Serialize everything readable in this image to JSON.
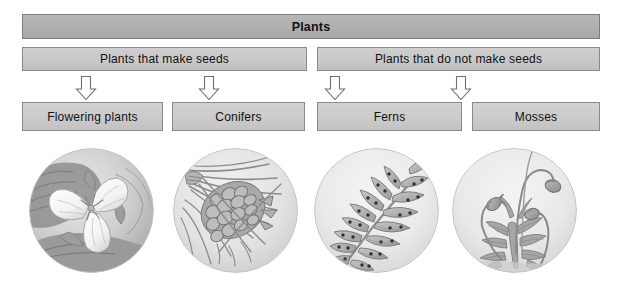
{
  "diagram": {
    "title": "Plants",
    "root": {
      "label": "Plants"
    },
    "level2": [
      {
        "id": "seeds",
        "label": "Plants that make seeds"
      },
      {
        "id": "noseeds",
        "label": "Plants that do not make seeds"
      }
    ],
    "leaves": [
      {
        "id": "flowering",
        "label": "Flowering plants",
        "parent": "seeds",
        "illustration": "flowering-plant-illustration"
      },
      {
        "id": "conifers",
        "label": "Conifers",
        "parent": "seeds",
        "illustration": "pine-cone-illustration"
      },
      {
        "id": "ferns",
        "label": "Ferns",
        "parent": "noseeds",
        "illustration": "fern-frond-illustration"
      },
      {
        "id": "mosses",
        "label": "Mosses",
        "parent": "noseeds",
        "illustration": "moss-sporophyte-illustration"
      }
    ],
    "connectors": [
      {
        "id": "arrow-flowering",
        "icon": "arrow-down-icon",
        "from": "seeds",
        "to": "flowering"
      },
      {
        "id": "arrow-conifers",
        "icon": "arrow-down-icon",
        "from": "seeds",
        "to": "conifers"
      },
      {
        "id": "arrow-ferns",
        "icon": "arrow-down-icon",
        "from": "noseeds",
        "to": "ferns"
      },
      {
        "id": "arrow-mosses",
        "icon": "arrow-down-icon",
        "from": "noseeds",
        "to": "mosses"
      }
    ],
    "colors": {
      "root_fill": "#b0b0b0",
      "box_fill": "#c8c8c8",
      "box_border": "#8a8a8a",
      "text": "#111111",
      "arrow_fill": "#ffffff",
      "arrow_stroke": "#6f6f6f",
      "illustration_ink": "#7b7b7b",
      "page_background": "#ffffff"
    }
  }
}
